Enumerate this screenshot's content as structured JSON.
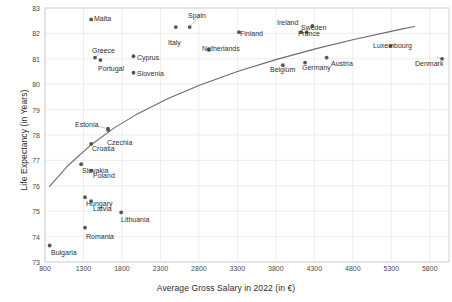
{
  "chart_data": {
    "type": "scatter",
    "title": "",
    "xlabel": "Average Gross Salary in 2022 (in €)",
    "ylabel": "Life Expectancy (in Years)",
    "xlim": [
      800,
      6050
    ],
    "ylim": [
      73,
      83
    ],
    "xticks": [
      800,
      1300,
      1800,
      2300,
      2800,
      3300,
      3800,
      4300,
      4800,
      5300,
      5800
    ],
    "yticks": [
      73,
      74,
      75,
      76,
      77,
      78,
      79,
      80,
      81,
      82,
      83
    ],
    "grid": true,
    "legend": "none",
    "marker_color": "#555555",
    "trendline_color": "#6b6b6b",
    "points": [
      {
        "label": "Malta",
        "x": 1400,
        "y": 82.55,
        "lx": 94,
        "ly": 15,
        "anchor": "left"
      },
      {
        "label": "Spain",
        "x": 2680,
        "y": 82.25,
        "lx": 188,
        "ly": 12,
        "anchor": "left"
      },
      {
        "label": "Italy",
        "x": 2500,
        "y": 82.25,
        "lx": 168,
        "ly": 39,
        "anchor": "left"
      },
      {
        "label": "Finland",
        "x": 3320,
        "y": 82.05,
        "lx": 240,
        "ly": 30,
        "anchor": "left"
      },
      {
        "label": "Ireland",
        "x": 4130,
        "y": 82.05,
        "lx": 277,
        "ly": 19,
        "anchor": "left"
      },
      {
        "label": "Sweden",
        "x": 4275,
        "y": 82.3,
        "lx": 301,
        "ly": 24,
        "anchor": "left"
      },
      {
        "label": "France",
        "x": 4200,
        "y": 82.05,
        "lx": 298,
        "ly": 30,
        "anchor": "left"
      },
      {
        "label": "Netherlands",
        "x": 2930,
        "y": 81.35,
        "lx": 202,
        "ly": 45,
        "anchor": "left"
      },
      {
        "label": "Luxembourg",
        "x": 5290,
        "y": 81.5,
        "lx": 373,
        "ly": 42,
        "anchor": "left"
      },
      {
        "label": "Denmark",
        "x": 5960,
        "y": 81.0,
        "lx": 415,
        "ly": 60,
        "anchor": "left"
      },
      {
        "label": "Cyprus",
        "x": 1950,
        "y": 81.1,
        "lx": 137,
        "ly": 54,
        "anchor": "left"
      },
      {
        "label": "Greece",
        "x": 1450,
        "y": 81.05,
        "lx": 92,
        "ly": 47,
        "anchor": "left"
      },
      {
        "label": "Portugal",
        "x": 1520,
        "y": 80.95,
        "lx": 98,
        "ly": 65,
        "anchor": "left"
      },
      {
        "label": "Slovenia",
        "x": 1950,
        "y": 80.45,
        "lx": 137,
        "ly": 70,
        "anchor": "left"
      },
      {
        "label": "Belgium",
        "x": 3890,
        "y": 80.75,
        "lx": 270,
        "ly": 66,
        "anchor": "left"
      },
      {
        "label": "Germany",
        "x": 4180,
        "y": 80.85,
        "lx": 302,
        "ly": 64,
        "anchor": "left"
      },
      {
        "label": "Austria",
        "x": 4460,
        "y": 81.05,
        "lx": 331,
        "ly": 60,
        "anchor": "left"
      },
      {
        "label": "Estonia",
        "x": 1620,
        "y": 78.25,
        "lx": 75,
        "ly": 121,
        "anchor": "left"
      },
      {
        "label": "Czechia",
        "x": 1620,
        "y": 78.2,
        "lx": 107,
        "ly": 139,
        "anchor": "left"
      },
      {
        "label": "Croatia",
        "x": 1400,
        "y": 77.65,
        "lx": 92,
        "ly": 145,
        "anchor": "left"
      },
      {
        "label": "Slovakia",
        "x": 1270,
        "y": 76.85,
        "lx": 82,
        "ly": 167,
        "anchor": "left"
      },
      {
        "label": "Poland",
        "x": 1400,
        "y": 76.6,
        "lx": 93,
        "ly": 172,
        "anchor": "left"
      },
      {
        "label": "Hungary",
        "x": 1320,
        "y": 75.55,
        "lx": 86,
        "ly": 200,
        "anchor": "left"
      },
      {
        "label": "Latvia",
        "x": 1400,
        "y": 75.4,
        "lx": 93,
        "ly": 205,
        "anchor": "left"
      },
      {
        "label": "Lithuania",
        "x": 1790,
        "y": 74.95,
        "lx": 121,
        "ly": 216,
        "anchor": "left"
      },
      {
        "label": "Romania",
        "x": 1320,
        "y": 74.35,
        "lx": 86,
        "ly": 233,
        "anchor": "left"
      },
      {
        "label": "Bulgaria",
        "x": 860,
        "y": 73.65,
        "lx": 51,
        "ly": 249,
        "anchor": "left"
      }
    ],
    "trendline": {
      "description": "logarithmic best fit curve",
      "points": [
        {
          "x": 860,
          "y": 75.98
        },
        {
          "x": 1100,
          "y": 76.8
        },
        {
          "x": 1400,
          "y": 77.62
        },
        {
          "x": 1700,
          "y": 78.28
        },
        {
          "x": 2000,
          "y": 78.83
        },
        {
          "x": 2400,
          "y": 79.44
        },
        {
          "x": 2800,
          "y": 79.95
        },
        {
          "x": 3300,
          "y": 80.5
        },
        {
          "x": 3800,
          "y": 80.97
        },
        {
          "x": 4300,
          "y": 81.38
        },
        {
          "x": 4800,
          "y": 81.75
        },
        {
          "x": 5400,
          "y": 82.15
        },
        {
          "x": 5600,
          "y": 82.27
        }
      ]
    }
  }
}
